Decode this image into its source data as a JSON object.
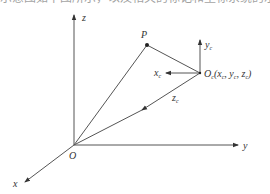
{
  "caption": "示意图如下图所示，以及相关的标记和坐标系统的示意。",
  "diagram": {
    "world_frame": {
      "origin_label": "O",
      "axes": {
        "x": "x",
        "y": "y",
        "z": "z"
      }
    },
    "point": {
      "label": "P"
    },
    "camera_frame": {
      "origin_label": "O",
      "origin_sub": "c",
      "coords_open": "(x",
      "coords_sub1": "c",
      "coords_sep1": ", y",
      "coords_sub2": "c",
      "coords_sep2": ", z",
      "coords_sub3": "c",
      "coords_close": ")",
      "axes": {
        "x": "x",
        "x_sub": "c",
        "y": "y",
        "y_sub": "c",
        "z": "z",
        "z_sub": "c"
      }
    },
    "colors": {
      "line": "#555555",
      "text": "#333333"
    }
  }
}
